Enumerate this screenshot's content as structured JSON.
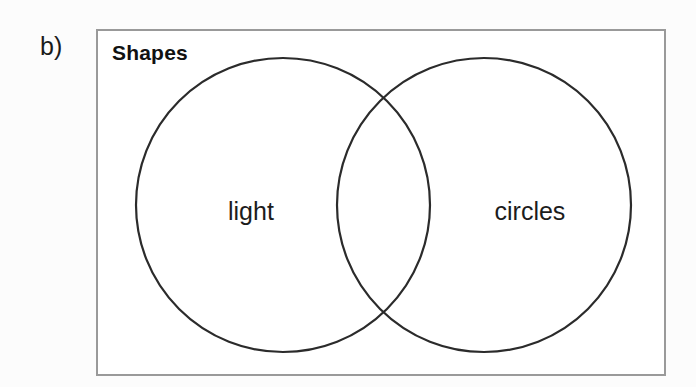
{
  "figure": {
    "part_label": "b)",
    "type": "venn-diagram",
    "universe_title": "Shapes",
    "sets": [
      {
        "id": "left",
        "label": "light",
        "label_x": 251,
        "label_y": 211
      },
      {
        "id": "right",
        "label": "circles",
        "label_x": 530,
        "label_y": 211
      }
    ],
    "geometry": {
      "frame": {
        "x": 96,
        "y": 29,
        "width": 570,
        "height": 347
      },
      "circle_left": {
        "cx": 283,
        "cy": 205,
        "r": 147
      },
      "circle_right": {
        "cx": 484,
        "cy": 205,
        "r": 147
      },
      "intersection_points": [
        {
          "x": 385,
          "y": 103
        },
        {
          "x": 385,
          "y": 325
        }
      ]
    },
    "colors": {
      "background": "#fcfcfc",
      "frame_border": "#9a9a9a",
      "circle_stroke": "#2b2b2b",
      "text": "#1a1a1a",
      "inner_fill": "#ffffff"
    },
    "regions": [
      {
        "name": "left-only",
        "description": "light but not circles"
      },
      {
        "name": "intersection",
        "description": "light circles"
      },
      {
        "name": "right-only",
        "description": "circles but not light"
      },
      {
        "name": "outside",
        "description": "neither light nor circles"
      }
    ]
  }
}
